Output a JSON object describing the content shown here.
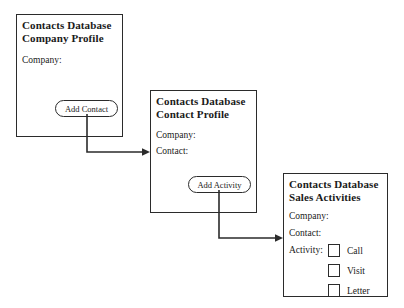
{
  "diagram": {
    "boxes": {
      "company_profile": {
        "title_line1": "Contacts Database",
        "title_line2": "Company Profile",
        "field_company": "Company:",
        "button_label": "Add Contact"
      },
      "contact_profile": {
        "title_line1": "Contacts Database",
        "title_line2": "Contact Profile",
        "field_company": "Company:",
        "field_contact": "Contact:",
        "button_label": "Add Activity"
      },
      "sales_activities": {
        "title_line1": "Contacts Database",
        "title_line2": "Sales Activities",
        "field_company": "Company:",
        "field_contact": "Contact:",
        "field_activity": "Activity:",
        "checkbox_call": "Call",
        "checkbox_visit": "Visit",
        "checkbox_letter": "Letter"
      }
    },
    "colors": {
      "line": "#2b2b2b",
      "text": "#1a1a1a",
      "background": "#ffffff"
    }
  }
}
